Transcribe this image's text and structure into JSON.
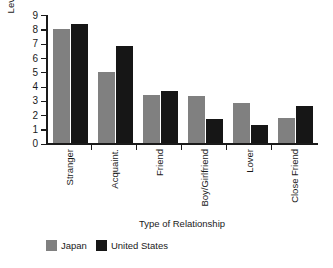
{
  "chart_data": {
    "type": "bar",
    "title": "",
    "xlabel": "Type of Relationship",
    "ylabel": "Level of Intimacy",
    "ylim": [
      0,
      9
    ],
    "yticks": [
      9,
      8,
      7,
      6,
      5,
      4,
      3,
      2,
      1,
      0
    ],
    "grid": false,
    "legend_position": "bottom-left",
    "categories": [
      "Stranger",
      "Acquaint.",
      "Friend",
      "Boy/Girlfriend",
      "Lover",
      "Close Friend"
    ],
    "series": [
      {
        "name": "Japan",
        "color": "#808080",
        "values": [
          8.0,
          5.0,
          3.4,
          3.3,
          2.8,
          1.8
        ]
      },
      {
        "name": "United States",
        "color": "#161616",
        "values": [
          8.4,
          6.8,
          3.7,
          1.7,
          1.3,
          2.6
        ]
      }
    ]
  }
}
